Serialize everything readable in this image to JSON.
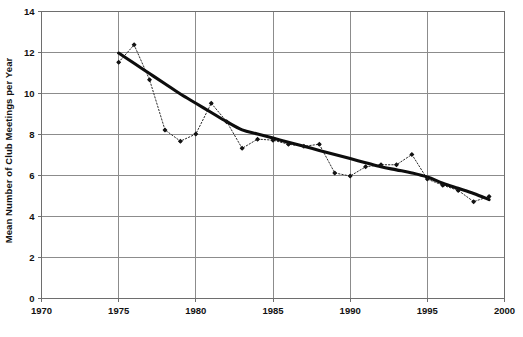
{
  "chart_data": {
    "type": "line",
    "title": "",
    "xlabel": "",
    "ylabel": "Mean Number of Club Meetings per Year",
    "xlim": [
      1970,
      2000
    ],
    "ylim": [
      0,
      14
    ],
    "xticks": [
      1970,
      1975,
      1980,
      1985,
      1990,
      1995,
      2000
    ],
    "yticks": [
      0,
      2,
      4,
      6,
      8,
      10,
      12,
      14
    ],
    "grid": true,
    "legend": "none",
    "x": [
      1975,
      1976,
      1977,
      1978,
      1979,
      1980,
      1981,
      1982,
      1983,
      1984,
      1985,
      1986,
      1987,
      1988,
      1989,
      1990,
      1991,
      1992,
      1993,
      1994,
      1995,
      1996,
      1997,
      1998,
      1999
    ],
    "series": [
      {
        "name": "Observed mean club meetings per year",
        "style": "dotted-with-markers",
        "color": "#1a1a1a",
        "values": [
          11.5,
          12.35,
          10.65,
          8.2,
          7.65,
          8.0,
          9.5,
          8.6,
          7.3,
          7.75,
          7.7,
          7.5,
          7.4,
          7.5,
          6.1,
          5.95,
          6.4,
          6.5,
          6.5,
          7.0,
          5.8,
          5.5,
          5.25,
          4.7,
          4.95
        ]
      },
      {
        "name": "Smoothed trend",
        "style": "thick-solid",
        "color": "#111111",
        "x": [
          1975,
          1976,
          1977,
          1978,
          1979,
          1980,
          1981,
          1982,
          1983,
          1984,
          1985,
          1986,
          1987,
          1988,
          1989,
          1990,
          1991,
          1992,
          1993,
          1994,
          1995,
          1996,
          1997,
          1998,
          1999
        ],
        "values": [
          11.95,
          11.45,
          10.95,
          10.45,
          9.95,
          9.5,
          9.05,
          8.6,
          8.2,
          8.0,
          7.8,
          7.6,
          7.4,
          7.2,
          7.0,
          6.8,
          6.6,
          6.4,
          6.25,
          6.1,
          5.9,
          5.6,
          5.35,
          5.1,
          4.8
        ]
      }
    ]
  },
  "axes": {
    "y_title": "Mean Number of Club Meetings per Year",
    "y_tick_labels": [
      "0",
      "2",
      "4",
      "6",
      "8",
      "10",
      "12",
      "14"
    ],
    "x_tick_labels": [
      "1970",
      "1975",
      "1980",
      "1985",
      "1990",
      "1995",
      "2000"
    ]
  },
  "colors": {
    "background": "#ffffff",
    "gridline": "#8c8c8c",
    "frame": "#6e6e6e",
    "marker": "#141414",
    "dotted_line": "#2b2b2b",
    "trend_line": "#0d0d0d",
    "text": "#111111"
  }
}
